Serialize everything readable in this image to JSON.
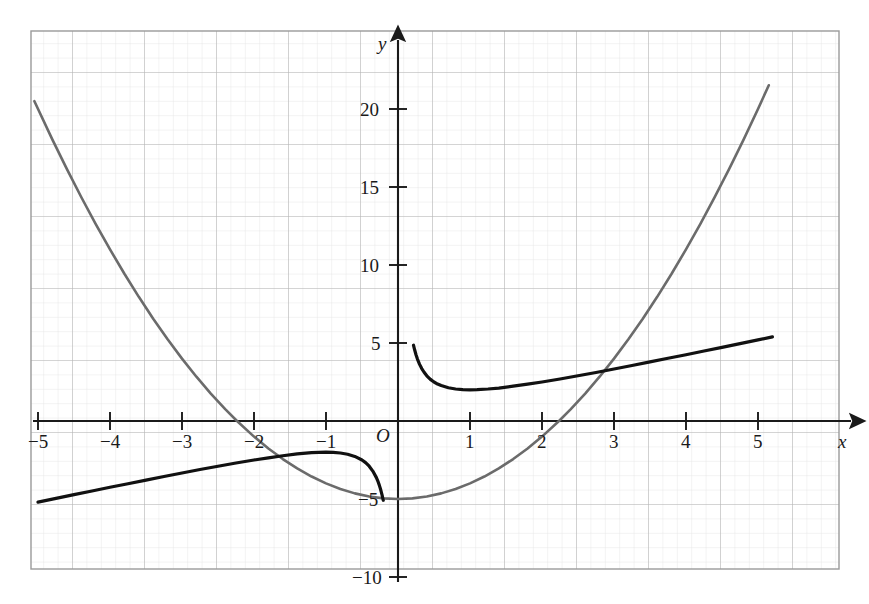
{
  "chart_data": {
    "type": "line",
    "title": "",
    "xlabel": "x",
    "ylabel": "y",
    "origin_label": "O",
    "grid": true,
    "grid_major_step": 1,
    "grid_minor_step": 0.2,
    "legend": "none",
    "xlim": [
      -5.35,
      5.9
    ],
    "ylim": [
      -10.9,
      24.9
    ],
    "xticks": [
      -5,
      -4,
      -3,
      -2,
      -1,
      1,
      2,
      3,
      4,
      5
    ],
    "xtick_labels": [
      "−5",
      "−4",
      "−3",
      "−2",
      "−1",
      "1",
      "2",
      "3",
      "4",
      "5"
    ],
    "yticks": [
      -10,
      -5,
      5,
      10,
      15,
      20
    ],
    "ytick_labels": [
      "−10",
      "−5",
      "5",
      "10",
      "15",
      "20"
    ],
    "series": [
      {
        "name": "parabola",
        "expression": "y = x^2 - 5",
        "color": "#6b6b6b",
        "width": 2.6,
        "vertex": [
          0,
          -5
        ],
        "roots": [
          -2.236,
          2.236
        ],
        "x": [
          -5.05,
          -4.8,
          -4.6,
          -4.4,
          -4.2,
          -4.0,
          -3.8,
          -3.6,
          -3.4,
          -3.2,
          -3.0,
          -2.8,
          -2.6,
          -2.4,
          -2.236,
          -2.0,
          -1.8,
          -1.6,
          -1.4,
          -1.2,
          -1.0,
          -0.8,
          -0.6,
          -0.4,
          -0.2,
          0.0,
          0.2,
          0.4,
          0.6,
          0.8,
          1.0,
          1.2,
          1.4,
          1.6,
          1.8,
          2.0,
          2.236,
          2.4,
          2.6,
          2.8,
          3.0,
          3.2,
          3.4,
          3.6,
          3.8,
          4.0,
          4.2,
          4.4,
          4.6,
          4.8,
          5.0,
          5.15
        ],
        "y": [
          20.5,
          18.04,
          16.16,
          14.36,
          12.64,
          11.0,
          9.44,
          7.96,
          6.56,
          5.24,
          4.0,
          2.84,
          1.76,
          0.76,
          0.0,
          -1.0,
          -1.76,
          -2.44,
          -3.04,
          -3.56,
          -4.0,
          -4.36,
          -4.64,
          -4.84,
          -4.96,
          -5.0,
          -4.96,
          -4.84,
          -4.64,
          -4.36,
          -4.0,
          -3.56,
          -3.04,
          -2.44,
          -1.76,
          -1.0,
          0.0,
          0.76,
          1.76,
          2.84,
          4.0,
          5.24,
          6.56,
          7.96,
          9.44,
          11.0,
          12.64,
          14.36,
          16.16,
          18.04,
          20.0,
          21.52
        ]
      },
      {
        "name": "reciprocal-sum",
        "expression": "y = x + 1/x",
        "color": "#111111",
        "width": 3.2,
        "minimum": [
          1,
          2
        ],
        "maximum": [
          -1,
          -2
        ],
        "asymptote_x": 0,
        "branch_left_x": [
          -5.0,
          -4.75,
          -4.5,
          -4.25,
          -4.0,
          -3.75,
          -3.5,
          -3.25,
          -3.0,
          -2.75,
          -2.5,
          -2.25,
          -2.0,
          -1.8,
          -1.6,
          -1.4,
          -1.2,
          -1.0,
          -0.9,
          -0.8,
          -0.7,
          -0.6,
          -0.5,
          -0.45,
          -0.4,
          -0.35,
          -0.3,
          -0.28,
          -0.26,
          -0.24,
          -0.22,
          -0.205
        ],
        "branch_left_y": [
          -5.2,
          -4.96,
          -4.72,
          -4.49,
          -4.25,
          -4.02,
          -3.79,
          -3.56,
          -3.33,
          -3.11,
          -2.9,
          -2.69,
          -2.5,
          -2.36,
          -2.23,
          -2.11,
          -2.03,
          -2.0,
          -2.01,
          -2.05,
          -2.13,
          -2.27,
          -2.5,
          -2.67,
          -2.9,
          -3.21,
          -3.63,
          -3.85,
          -4.11,
          -4.41,
          -4.77,
          -5.08
        ],
        "branch_right_x": [
          0.215,
          0.23,
          0.25,
          0.27,
          0.3,
          0.33,
          0.36,
          0.4,
          0.45,
          0.5,
          0.55,
          0.6,
          0.7,
          0.8,
          0.9,
          1.0,
          1.1,
          1.25,
          1.4,
          1.6,
          1.8,
          2.0,
          2.25,
          2.5,
          2.75,
          3.0,
          3.25,
          3.5,
          3.75,
          4.0,
          4.25,
          4.5,
          4.75,
          5.0,
          5.2
        ],
        "branch_right_y": [
          4.86,
          4.58,
          4.25,
          3.97,
          3.63,
          3.36,
          3.14,
          2.9,
          2.67,
          2.5,
          2.37,
          2.27,
          2.13,
          2.05,
          2.01,
          2.0,
          2.01,
          2.05,
          2.11,
          2.23,
          2.36,
          2.5,
          2.69,
          2.9,
          3.11,
          3.33,
          3.56,
          3.79,
          4.02,
          4.25,
          4.49,
          4.72,
          4.96,
          5.2,
          5.39
        ]
      }
    ]
  },
  "axes": {
    "x_label": "x",
    "y_label": "y",
    "origin": "O"
  }
}
